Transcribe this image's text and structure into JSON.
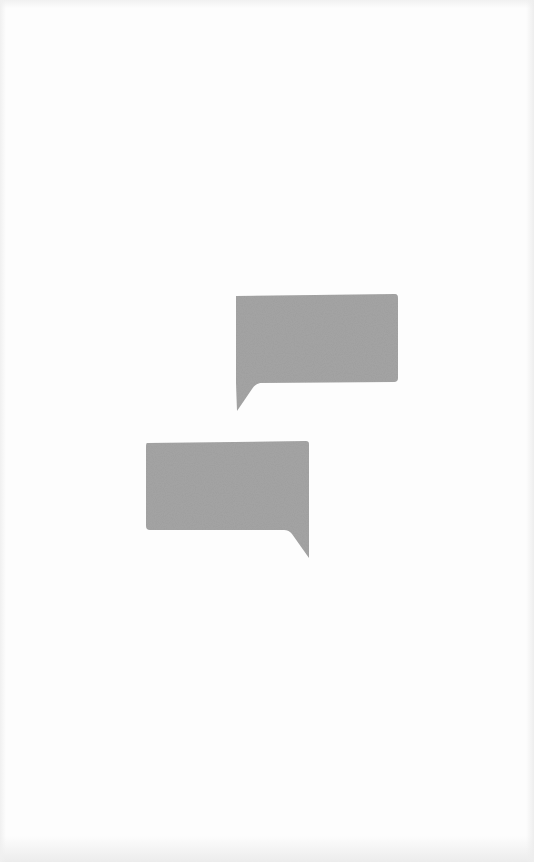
{
  "illustration": {
    "description": "two-speech-bubbles",
    "page_background": "#fdfdfd",
    "bubble_fill": "#a6a6a6",
    "bubbles": [
      {
        "name": "speech-bubble-upper-right",
        "tail": "bottom-left",
        "text": ""
      },
      {
        "name": "speech-bubble-lower-left",
        "tail": "bottom-right",
        "text": ""
      }
    ]
  }
}
